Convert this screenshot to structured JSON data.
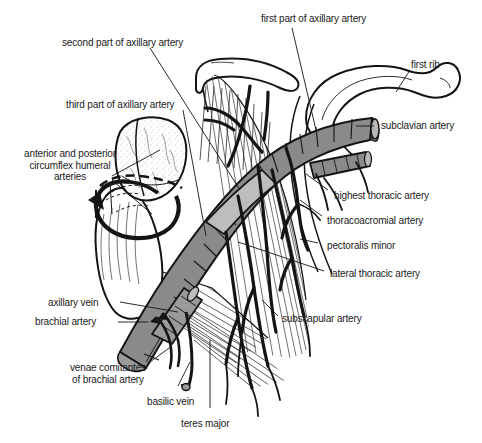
{
  "figure": {
    "background_color": "#ffffff",
    "ink_color": "#1a1a1a",
    "artery_fill": "#8a8a8a",
    "vein_fill": "#9a9a9a",
    "bone_fill": "#ffffff",
    "muscle_fill": "#d8d8d8"
  },
  "labels": {
    "first_part": "first part of axillary artery",
    "second_part": "second part of axillary artery",
    "third_part": "third part of axillary artery",
    "first_rib": "first rib",
    "subclavian_artery": "subclavian artery",
    "highest_thoracic_artery": "highest thoracic artery",
    "thoracoacromial_artery": "thoracoacromial artery",
    "pectoralis_minor": "pectoralis minor",
    "lateral_thoracic_artery": "lateral thoracic artery",
    "subscapular_artery": "subscapular artery",
    "circumflex_humeral": "anterior and posterior\ncircumflex humeral\narteries",
    "axillary_vein": "axillary vein",
    "brachial_artery": "brachial artery",
    "venae_comitantes": "venae comitantes\nof brachial artery",
    "basilic_vein": "basilic vein",
    "teres_major": "teres major"
  }
}
